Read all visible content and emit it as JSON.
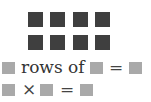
{
  "array": {
    "rows": 2,
    "columns": 4,
    "square_color": "#3f3f3f"
  },
  "sentence": {
    "blank_1": "",
    "text": "rows of",
    "blank_2": "",
    "equals": "=",
    "blank_3": ""
  },
  "equation": {
    "blank_1": "",
    "times": "×",
    "blank_2": "",
    "equals": "=",
    "blank_3": ""
  },
  "colors": {
    "blank_box": "#a9a9a9",
    "array_square": "#3f3f3f"
  }
}
